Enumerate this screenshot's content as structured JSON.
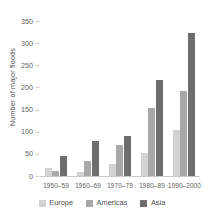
{
  "chart_data": {
    "type": "bar",
    "title": "",
    "xlabel": "",
    "ylabel": "Number of major floods",
    "categories": [
      "1950–59",
      "1960–69",
      "1970–79",
      "1980–89",
      "1990–2000"
    ],
    "series": [
      {
        "name": "Europe",
        "color": "#d2d2d2",
        "values": [
          18,
          8,
          27,
          52,
          105
        ]
      },
      {
        "name": "Americas",
        "color": "#a8a8a8",
        "values": [
          11,
          34,
          69,
          153,
          193
        ]
      },
      {
        "name": "Asia",
        "color": "#6e6e6e",
        "values": [
          45,
          79,
          91,
          216,
          323
        ]
      }
    ],
    "ylim": [
      0,
      350
    ],
    "yticks": [
      0,
      50,
      100,
      150,
      200,
      250,
      300,
      350
    ],
    "ytick_labels": [
      "0",
      "50",
      "100",
      "150",
      "200",
      "250",
      "300",
      "350"
    ],
    "grid": false,
    "legend_position": "bottom-center",
    "bar_orientation": "vertical",
    "axis_color": "#c9c9c9",
    "text_color": "#5c5c5c"
  }
}
